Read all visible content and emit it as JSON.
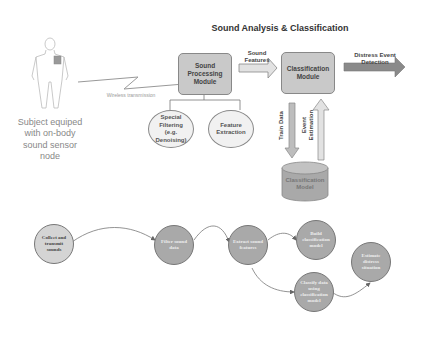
{
  "top_panel": {
    "title": "Sound Analysis & Classification",
    "sound_processing_module": "Sound Processing Module",
    "classification_module": "Classification Module",
    "sound_features_label": "Sound Features",
    "distress_label": "Distress Event Detection",
    "special_filtering": "Special Filtering (e.g. Denoising)",
    "feature_extraction": "Feature Extraction",
    "train_data": "Train Data",
    "event_estimation": "Event Estimation",
    "classification_model": "Classification Model"
  },
  "subject": {
    "caption": "Subject equiped with on-body sound sensor node",
    "wireless_label": "Wireless transmission"
  },
  "bottom_flow": {
    "nodes": [
      {
        "id": "collect",
        "label": "Collect and transmit sounds"
      },
      {
        "id": "filter",
        "label": "Filter sound data"
      },
      {
        "id": "extract",
        "label": "Extract sound features"
      },
      {
        "id": "build",
        "label": "Build classification model"
      },
      {
        "id": "classify",
        "label": "Classify data using classification model"
      },
      {
        "id": "estimate",
        "label": "Estimate distress situation"
      }
    ]
  },
  "colors": {
    "panel_bg": "#e9e9e9",
    "module_fill": "#c9c9c9",
    "node_dark": "#a9a9a9",
    "node_light": "#d4d4d4",
    "arrow_dark": "#8a8a8a"
  }
}
